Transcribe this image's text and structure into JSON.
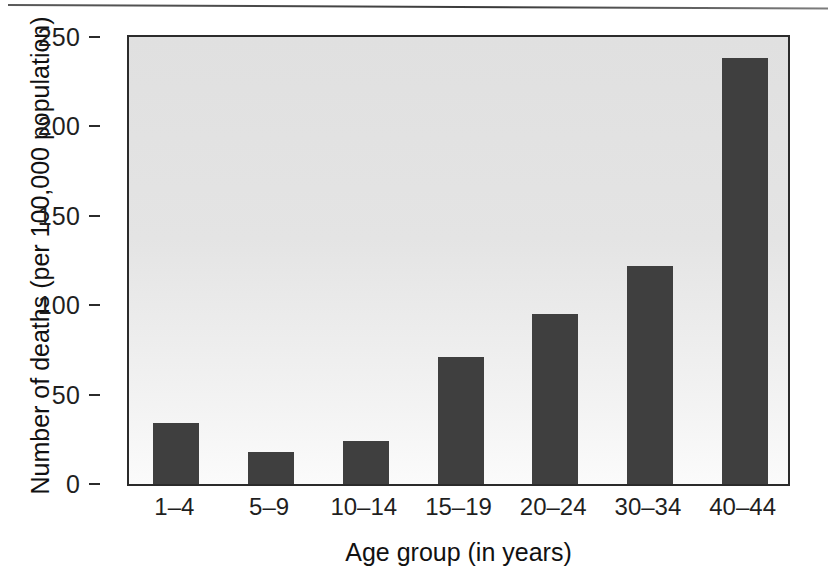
{
  "chart_data": {
    "type": "bar",
    "title": "",
    "subtitle": "",
    "xlabel": "Age group (in years)",
    "ylabel": "Number of deaths (per 100,000 population)",
    "categories": [
      "1–4",
      "5–9",
      "10–14",
      "15–19",
      "20–24",
      "30–34",
      "40–44"
    ],
    "values": [
      34,
      18,
      24,
      71,
      95,
      122,
      238
    ],
    "ylim": [
      0,
      250
    ],
    "yticks": [
      0,
      50,
      100,
      150,
      200,
      250
    ],
    "ytick_labels": [
      "0",
      "50",
      "100",
      "150",
      "200",
      "250"
    ],
    "grid": false,
    "legend": null,
    "legend_position": "none",
    "annotations": [],
    "bar_color": "#3f3f3f",
    "plot_background": "#e4e4e4",
    "axis_color": "#2b2b2b"
  },
  "figure": {
    "axis_title_y": "Number of deaths (per 100,000 population)",
    "axis_title_x": "Age group (in years)"
  }
}
